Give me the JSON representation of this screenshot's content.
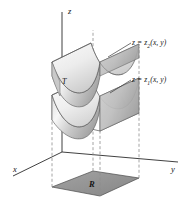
{
  "figure": {
    "background_color": "#ffffff",
    "axes": {
      "z_label": "z",
      "x_label": "x",
      "y_label": "y",
      "axis_color": "#2b2b2b"
    },
    "labels": {
      "solid_label": "T",
      "region_label": "R",
      "upper_surface_label_z": "z",
      "upper_surface_label_eq": " = ",
      "upper_surface_label_fn": "z",
      "upper_surface_label_sub": "2",
      "upper_surface_label_args": "(x, y)",
      "upper_surface_full": "z = z2(x, y)",
      "lower_surface_label_z": "z",
      "lower_surface_label_eq": " = ",
      "lower_surface_label_fn": "z",
      "lower_surface_label_sub": "1",
      "lower_surface_label_args": "(x, y)",
      "lower_surface_full": "z = z1(x, y)"
    },
    "colors": {
      "region_fill": "#9a9a9a",
      "region_edge": "#4a4a4a",
      "surface_light": "#f2f2f2",
      "surface_mid": "#d4d4d4",
      "surface_dark": "#a8a8a8",
      "dashed_line": "#8d8d8d",
      "box_edge": "#555555",
      "text": "#141414"
    }
  }
}
